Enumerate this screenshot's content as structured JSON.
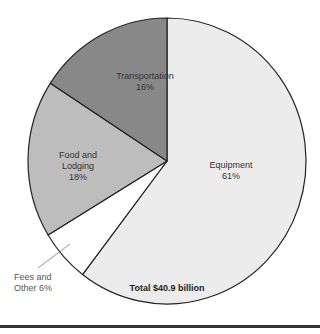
{
  "chart_data": {
    "type": "pie",
    "title": "",
    "categories": [
      "Equipment",
      "Fees and Other",
      "Food and Lodging",
      "Transportation"
    ],
    "values": [
      61,
      6,
      18,
      16
    ],
    "labels": [
      "Equipment 61%",
      "Fees and Other 6%",
      "Food and Lodging 18%",
      "Transportation 16%"
    ],
    "colors": [
      "#ececec",
      "#ffffff",
      "#bdbdbd",
      "#888888"
    ],
    "unit": "%",
    "total": "Total $40.9 billion",
    "legend": "none (direct labels)"
  },
  "labels": {
    "equipment": {
      "name": "Equipment",
      "pct": "61%"
    },
    "fees": {
      "line1": "Fees and",
      "line2": "Other 6%"
    },
    "food": {
      "line1": "Food and",
      "line2": "Lodging",
      "pct": "18%"
    },
    "transportation": {
      "name": "Transportation",
      "pct": "16%"
    }
  },
  "footer": {
    "total": "Total $40.9 billion"
  }
}
